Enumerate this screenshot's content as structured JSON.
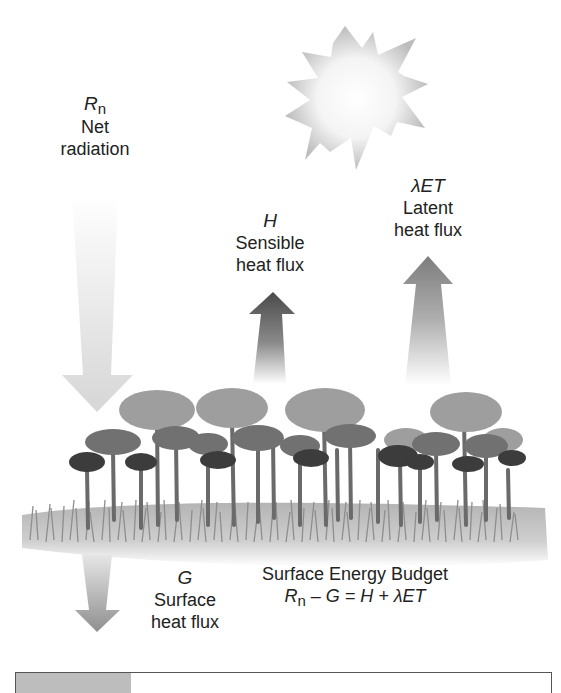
{
  "diagram": {
    "title": "Surface Energy Budget",
    "equation": {
      "rn": "R",
      "rn_sub": "n",
      "rest": " – G = H + λET"
    },
    "fluxes": [
      {
        "id": "net_radiation",
        "symbol": "R",
        "symbol_sub": "n",
        "line1": "Net",
        "line2": "radiation",
        "direction": "down",
        "shade": "#d8d8d8"
      },
      {
        "id": "sensible_heat",
        "symbol": "H",
        "symbol_sub": "",
        "line1": "Sensible",
        "line2": "heat flux",
        "direction": "up",
        "shade": "#555555"
      },
      {
        "id": "latent_heat",
        "symbol": "λET",
        "symbol_sub": "",
        "line1": "Latent",
        "line2": "heat flux",
        "direction": "up",
        "shade": "#8a8a8a"
      },
      {
        "id": "surface_heat",
        "symbol": "G",
        "symbol_sub": "",
        "line1": "Surface",
        "line2": "heat flux",
        "direction": "down",
        "shade": "#9a9a9a"
      }
    ],
    "elements": {
      "sun": "sun",
      "vegetation": "forest-canopy",
      "ground": "grass-surface"
    },
    "colors": {
      "background": "#ffffff",
      "text": "#222222",
      "tree_light": "#9a9a9a",
      "tree_mid": "#6e6e6e",
      "tree_dark": "#3a3a3a",
      "grass": "#a8a8a8"
    }
  }
}
